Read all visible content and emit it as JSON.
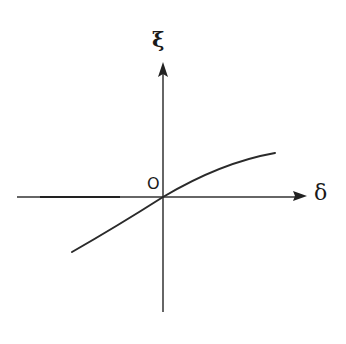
{
  "diagram": {
    "type": "function-sketch",
    "axes": {
      "x": {
        "label": "δ",
        "direction": "right",
        "arrow": true
      },
      "y": {
        "label": "ξ",
        "direction": "up",
        "arrow": true
      },
      "origin_label": "O"
    },
    "curve": {
      "shape": "increasing, passes through origin, steeper on left, flattening to the right (saturating)",
      "points_px": [
        [
          72,
          252
        ],
        [
          100,
          236
        ],
        [
          130,
          218
        ],
        [
          163,
          197
        ],
        [
          190,
          184
        ],
        [
          220,
          170
        ],
        [
          250,
          158
        ],
        [
          275,
          153
        ]
      ]
    },
    "colors": {
      "stroke": "#2a2a2a",
      "background": "#ffffff"
    }
  }
}
